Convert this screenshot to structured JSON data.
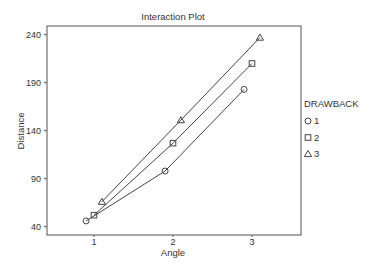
{
  "chart_data": {
    "type": "line",
    "title": "Interaction Plot",
    "xlabel": "Angle",
    "ylabel": "Distance",
    "categories": [
      "1",
      "2",
      "3"
    ],
    "x_ticks": [
      "1",
      "2",
      "3"
    ],
    "y_ticks": [
      40,
      90,
      140,
      190,
      240
    ],
    "ylim": [
      40,
      240
    ],
    "grid": false,
    "legend": {
      "title": "DRAWBACK",
      "position": "right",
      "entries": [
        {
          "label": "1",
          "marker": "circle"
        },
        {
          "label": "2",
          "marker": "square"
        },
        {
          "label": "3",
          "marker": "triangle"
        }
      ]
    },
    "series": [
      {
        "name": "1",
        "marker": "circle",
        "x_offset": -0.1,
        "values": [
          46,
          98,
          183
        ]
      },
      {
        "name": "2",
        "marker": "square",
        "x_offset": 0.0,
        "values": [
          52,
          127,
          210
        ]
      },
      {
        "name": "3",
        "marker": "triangle",
        "x_offset": 0.1,
        "values": [
          66,
          151,
          237
        ]
      }
    ]
  },
  "colors": {
    "line": "#444444",
    "axis": "#555555",
    "text": "#333333"
  }
}
